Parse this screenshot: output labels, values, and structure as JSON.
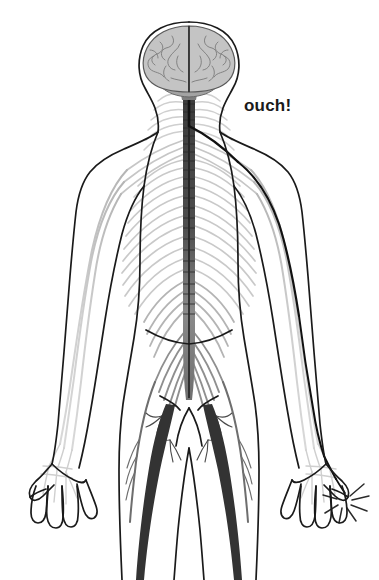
{
  "figure": {
    "view": "posterior full-body anatomical diagram",
    "background_color": "#ffffff"
  },
  "annotation": {
    "ouch_text": "ouch!",
    "ouch_color": "#1a1a1a",
    "ouch_x": 244,
    "ouch_y": 97,
    "ouch_font_size": 17
  },
  "palette": {
    "body_outline": "#1a1a1a",
    "nerve_light": "#c9c9c9",
    "nerve_mid": "#9a9a9a",
    "nerve_dark": "#4a4a4a",
    "pain_path": "#111111",
    "brain_fill": "#c4c4c4",
    "brain_stroke": "#5a5a5a",
    "cerebellum_fill": "#a0a0a0",
    "brainstem_fill": "#7a7a7a",
    "spark_color": "#2a2a2a"
  },
  "anatomy": {
    "parts": [
      {
        "name": "head-outline",
        "label": "Head"
      },
      {
        "name": "brain",
        "label": "Brain (cerebrum)"
      },
      {
        "name": "cerebellum",
        "label": "Cerebellum"
      },
      {
        "name": "brainstem",
        "label": "Brainstem"
      },
      {
        "name": "spinal-cord",
        "label": "Spinal cord"
      },
      {
        "name": "cervical-nerves",
        "label": "Cervical nerves"
      },
      {
        "name": "brachial-plexus",
        "label": "Brachial plexus"
      },
      {
        "name": "intercostal-nerves",
        "label": "Intercostal nerves"
      },
      {
        "name": "lumbar-plexus",
        "label": "Lumbar plexus"
      },
      {
        "name": "sacral-plexus",
        "label": "Sacral plexus"
      },
      {
        "name": "sciatic-nerve",
        "label": "Sciatic nerve"
      },
      {
        "name": "radial-nerve",
        "label": "Arm nerves"
      },
      {
        "name": "hand-nerves",
        "label": "Hand nerves"
      }
    ],
    "highlight": {
      "name": "pain-signal-pathway",
      "label": "Pain signal pathway from right hand to brain",
      "origin": "right hand little finger",
      "destination": "brain"
    },
    "spark": {
      "name": "pain-spark",
      "label": "Pain spark at fingertip",
      "ray_count": 7
    }
  }
}
